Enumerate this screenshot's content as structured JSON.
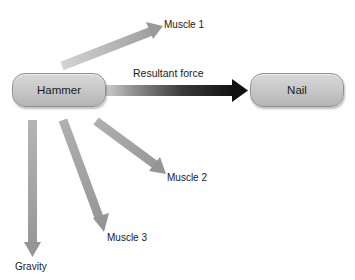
{
  "diagram": {
    "nodes": {
      "hammer": {
        "label": "Hammer"
      },
      "nail": {
        "label": "Nail"
      }
    },
    "arrows": {
      "resultant": {
        "label": "Resultant force",
        "color_start": "#c8c8c8",
        "color_end": "#111111"
      },
      "muscle1": {
        "label": "Muscle 1"
      },
      "muscle2": {
        "label": "Muscle 2"
      },
      "muscle3": {
        "label": "Muscle 3"
      },
      "gravity": {
        "label": "Gravity"
      }
    },
    "colors": {
      "force_arrow": "#9a9a9a",
      "node_fill": "#c6c6c6",
      "node_border": "#8f8f8f",
      "text": "#1a1a1a"
    }
  }
}
